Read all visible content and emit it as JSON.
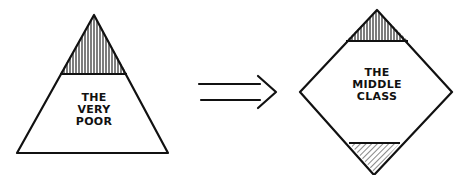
{
  "diagram": {
    "left_shape": {
      "type": "triangle",
      "label_lines": [
        "THE",
        "VERY",
        "POOR"
      ],
      "shaded_region": "top"
    },
    "arrow": {
      "type": "double-line-arrow",
      "direction": "right"
    },
    "right_shape": {
      "type": "diamond",
      "label_lines": [
        "THE",
        "MIDDLE",
        "CLASS"
      ],
      "shaded_regions": [
        "top",
        "bottom"
      ]
    },
    "colors": {
      "ink": "#111111",
      "background": "#ffffff"
    }
  }
}
